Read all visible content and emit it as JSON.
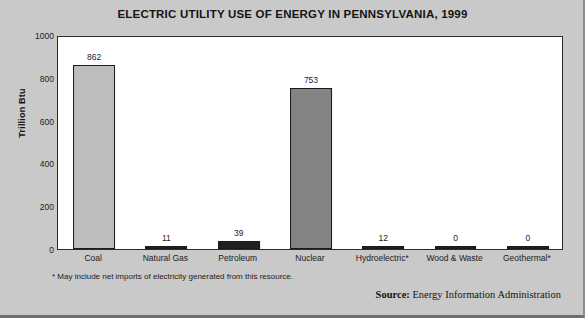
{
  "chart_data": {
    "type": "bar",
    "title": "ELECTRIC UTILITY USE OF ENERGY IN PENNSYLVANIA, 1999",
    "xlabel": "",
    "ylabel": "Trillion Btu",
    "ylim": [
      0,
      1000
    ],
    "ytick_labels": [
      "1000",
      "800",
      "600",
      "400",
      "200",
      "0"
    ],
    "ytick_values": [
      1000,
      800,
      600,
      400,
      200,
      0
    ],
    "grid": false,
    "legend": "none",
    "categories": [
      "Coal",
      "Natural Gas",
      "Petroleum",
      "Nuclear",
      "Hydroelectric*",
      "Wood & Waste",
      "Geothermal*"
    ],
    "values": [
      862,
      11,
      39,
      753,
      12,
      0,
      0
    ],
    "value_labels": [
      "862",
      "11",
      "39",
      "753",
      "12",
      "0",
      "0"
    ],
    "bar_colors": [
      "#bdbdbd",
      "#1f1f1f",
      "#1f1f1f",
      "#838383",
      "#1f1f1f",
      "#1f1f1f",
      "#1f1f1f"
    ],
    "footnote": "* May include net imports of electricity generated from this resource.",
    "source_label": "Source:",
    "source_text": " Energy Information Administration"
  },
  "colors": {
    "background": "#c9c9c9",
    "plot_background": "#ffffff",
    "axis": "#2b2b2b",
    "text": "#141414"
  }
}
